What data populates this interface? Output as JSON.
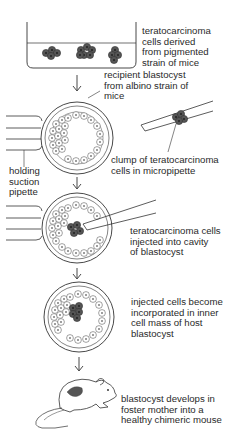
{
  "diagram": {
    "type": "process-flow",
    "steps": [
      {
        "id": "culture",
        "label_lines": [
          "teratocarcinoma",
          "cells derived",
          "from pigmented",
          "strain of mice"
        ]
      },
      {
        "id": "recipient",
        "label_lines": [
          "recipient blastocyst",
          "from albino strain of",
          "mice"
        ]
      },
      {
        "id": "injection",
        "label_lines": [
          "teratocarcinoma cells",
          "injected into cavity",
          "of blastocyst"
        ]
      },
      {
        "id": "incorporation",
        "label_lines": [
          "injected cells become",
          "incorporated in inner",
          "cell mass of host",
          "blastocyst"
        ]
      },
      {
        "id": "chimera",
        "label_lines": [
          "blastocyst develops in",
          "foster mother into a",
          "healthy chimeric mouse"
        ]
      }
    ],
    "annotations": {
      "holding_pipette": [
        "holding",
        "suction",
        "pipette"
      ],
      "micropipette_clump": [
        "clump of teratocarcinoma",
        "cells in micropipette"
      ]
    },
    "arrows": 4,
    "colors": {
      "line": "#333333",
      "cell_dark": "#4a4a4a",
      "background": "#ffffff"
    }
  }
}
